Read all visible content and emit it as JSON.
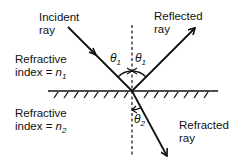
{
  "labels": {
    "incident": {
      "line1": "Incident",
      "line2": "ray"
    },
    "reflected": {
      "line1": "Reflected",
      "line2": "ray"
    },
    "refracted": {
      "line1": "Refracted",
      "line2": "ray"
    },
    "medium1": {
      "line1": "Refractive",
      "line2_prefix": "index = ",
      "symbol": "n",
      "subscript": "1"
    },
    "medium2": {
      "line1": "Refractive",
      "line2_prefix": "index = ",
      "symbol": "n",
      "subscript": "2"
    }
  },
  "angles": {
    "incidence": {
      "symbol": "θ",
      "subscript": "1"
    },
    "reflection": {
      "symbol": "θ",
      "subscript": "1"
    },
    "refraction": {
      "symbol": "θ",
      "subscript": "2"
    }
  },
  "colors": {
    "stroke": "#111111",
    "background": "#ffffff"
  }
}
